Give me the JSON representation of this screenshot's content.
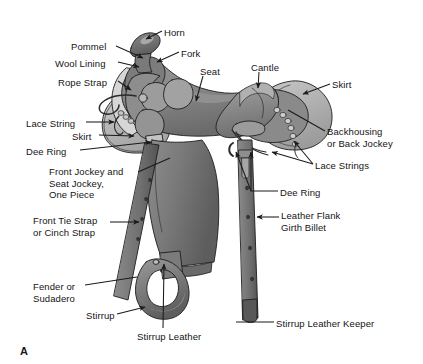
{
  "figure": {
    "panel_letter": "A",
    "background_color": "#ffffff",
    "text_color": "#141414",
    "leader_line_color": "#1a1a1a"
  },
  "palette": {
    "outline": "#1d1d1d",
    "leather_dark": "#4f4f4f",
    "leather_mid": "#6e6e6e",
    "leather_light": "#8f8f8f",
    "leather_pale": "#b4b4b4",
    "wool_lining": "#d2d2d2",
    "highlight": "#e2e2e2"
  },
  "labels": [
    {
      "id": "horn",
      "text": "Horn",
      "x": 164,
      "y": 27,
      "align": "left"
    },
    {
      "id": "pommel",
      "text": "Pommel",
      "x": 71,
      "y": 41,
      "align": "left"
    },
    {
      "id": "fork",
      "text": "Fork",
      "x": 181,
      "y": 48,
      "align": "left"
    },
    {
      "id": "wool-lining",
      "text": "Wool Lining",
      "x": 55,
      "y": 58,
      "align": "left"
    },
    {
      "id": "seat",
      "text": "Seat",
      "x": 200,
      "y": 66,
      "align": "left"
    },
    {
      "id": "cantle",
      "text": "Cantle",
      "x": 251,
      "y": 62,
      "align": "left"
    },
    {
      "id": "rope-strap",
      "text": "Rope Strap",
      "x": 58,
      "y": 77,
      "align": "left"
    },
    {
      "id": "skirt-right",
      "text": "Skirt",
      "x": 332,
      "y": 79,
      "align": "left"
    },
    {
      "id": "lace-string",
      "text": "Lace String",
      "x": 26,
      "y": 118,
      "align": "left"
    },
    {
      "id": "skirt-left",
      "text": "Skirt",
      "x": 72,
      "y": 131,
      "align": "left"
    },
    {
      "id": "backhousing",
      "text": "Backhousing\nor Back Jockey",
      "x": 327,
      "y": 126,
      "align": "left"
    },
    {
      "id": "dee-ring-left",
      "text": "Dee Ring",
      "x": 26,
      "y": 146,
      "align": "left"
    },
    {
      "id": "lace-strings",
      "text": "Lace Strings",
      "x": 315,
      "y": 160,
      "align": "left"
    },
    {
      "id": "front-seat-jockey",
      "text": "Front Jockey and\nSeat Jockey,\nOne Piece",
      "x": 49,
      "y": 166,
      "align": "left"
    },
    {
      "id": "dee-ring-right",
      "text": "Dee Ring",
      "x": 280,
      "y": 187,
      "align": "left"
    },
    {
      "id": "leather-flank",
      "text": "Leather Flank\nGirth Billet",
      "x": 281,
      "y": 210,
      "align": "left"
    },
    {
      "id": "front-tie-strap",
      "text": "Front Tie Strap\nor Cinch Strap",
      "x": 33,
      "y": 215,
      "align": "left"
    },
    {
      "id": "fender-sudadero",
      "text": "Fender or\nSudadero",
      "x": 33,
      "y": 281,
      "align": "left"
    },
    {
      "id": "stirrup",
      "text": "Stirrup",
      "x": 86,
      "y": 310,
      "align": "left"
    },
    {
      "id": "stirrup-leather-keeper",
      "text": "Stirrup Leather Keeper",
      "x": 276,
      "y": 318,
      "align": "left"
    },
    {
      "id": "stirrup-leather",
      "text": "Stirrup Leather",
      "x": 137,
      "y": 331,
      "align": "left"
    }
  ],
  "leaders": [
    {
      "id": "horn",
      "points": "162,31 146,39",
      "arrow": true
    },
    {
      "id": "pommel",
      "points": "116,46 143,58",
      "arrow": true
    },
    {
      "id": "fork",
      "points": "179,52 157,62",
      "arrow": true
    },
    {
      "id": "wool-lining",
      "points": "118,62 139,67",
      "arrow": true
    },
    {
      "id": "seat",
      "points": "203,76 196,101",
      "arrow": true
    },
    {
      "id": "cantle",
      "points": "259,72 258,88",
      "arrow": true
    },
    {
      "id": "rope-strap",
      "points": "118,81 130,89",
      "arrow": true
    },
    {
      "id": "skirt-right",
      "points": "330,84 303,94",
      "arrow": true
    },
    {
      "id": "lace-string",
      "points": "86,122 114,122",
      "arrow": true
    },
    {
      "id": "skirt-left",
      "points": "99,135 134,135",
      "arrow": true
    },
    {
      "id": "backhousing",
      "points": "325,131 290,110",
      "arrow": false
    },
    {
      "id": "dee-ring-left",
      "points": "80,150 152,142",
      "arrow": true
    },
    {
      "id": "lace-strings",
      "points": "313,164 270,153",
      "arrow": true
    },
    {
      "id": "lace-strings-b",
      "points": "313,164 292,143",
      "arrow": true
    },
    {
      "id": "front-seat-jockey",
      "points": "138,172 168,160",
      "arrow": false
    },
    {
      "id": "dee-ring-right",
      "points": "278,191 249,191 249,149",
      "arrow": true
    },
    {
      "id": "dee-ring-right-b",
      "points": "249,191 237,152",
      "arrow": true
    },
    {
      "id": "leather-flank",
      "points": "279,217 256,217",
      "arrow": true
    },
    {
      "id": "front-tie-strap",
      "points": "110,222 138,222",
      "arrow": true
    },
    {
      "id": "fender-sudadero",
      "points": "85,285 137,276",
      "arrow": false
    },
    {
      "id": "stirrup",
      "points": "117,314 146,306",
      "arrow": true
    },
    {
      "id": "stirrup-leather",
      "points": "163,330 163,261",
      "arrow": true
    },
    {
      "id": "stirrup-leather-keeper",
      "points": "274,322 240,322",
      "arrow": false
    }
  ]
}
